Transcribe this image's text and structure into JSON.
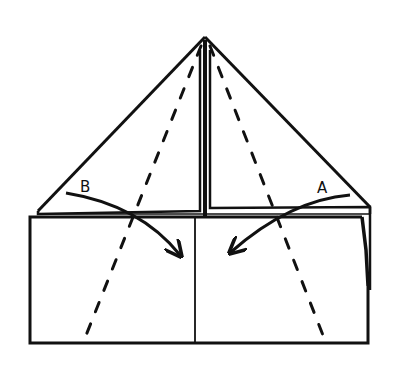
{
  "diagram": {
    "type": "origami-fold-instruction",
    "labels": {
      "a": "A",
      "b": "B"
    },
    "colors": {
      "line": "#111111",
      "background": "#ffffff"
    },
    "elements": {
      "triangle_flap": "folded triangle top with apex",
      "front_panel": "rectangular front panel split by center line",
      "dashed_fold_left": "valley fold line (left)",
      "dashed_fold_right": "valley fold line (right)",
      "arrow_b": "fold arrow from B toward center",
      "arrow_a": "fold arrow from A toward center"
    }
  }
}
